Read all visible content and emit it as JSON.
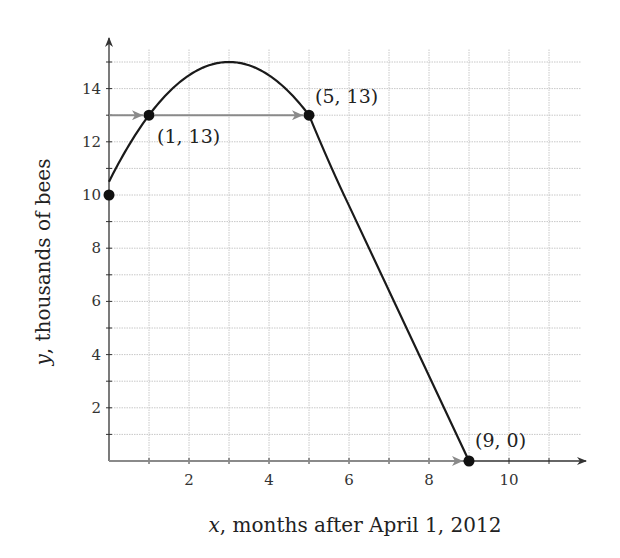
{
  "chart_data": {
    "type": "line",
    "title": "",
    "xlabel": "x, months after April 1, 2012",
    "xlabel_var": "x",
    "xlabel_rest": ", months after April 1, 2012",
    "ylabel": "y, thousands of bees",
    "ylabel_var": "y",
    "ylabel_rest": ", thousands of bees",
    "xlim": [
      0,
      12
    ],
    "ylim": [
      0,
      16
    ],
    "x_ticks": [
      2,
      4,
      6,
      8,
      10
    ],
    "y_ticks": [
      2,
      4,
      6,
      8,
      10,
      12,
      14
    ],
    "grid": true,
    "grid_x_step": 1,
    "grid_y_step": 1,
    "series": [
      {
        "name": "bee population",
        "piecewise": [
          {
            "form": "quadratic",
            "equation": "y = -1/2 (x-3)^2 + 15",
            "domain": [
              0,
              5
            ]
          },
          {
            "form": "linear",
            "from": [
              5,
              13
            ],
            "to": [
              9,
              0
            ]
          }
        ],
        "x": [
          0,
          0.5,
          1,
          1.5,
          2,
          2.5,
          3,
          3.5,
          4,
          4.5,
          5,
          6,
          7,
          8,
          9
        ],
        "values": [
          10.5,
          11.875,
          13,
          13.875,
          14.5,
          14.875,
          15,
          14.875,
          14.5,
          13.875,
          13,
          9.75,
          6.5,
          3.25,
          0
        ]
      }
    ],
    "marked_points": [
      {
        "x": 0,
        "y": 10,
        "label": ""
      },
      {
        "x": 1,
        "y": 13,
        "label": "(1, 13)"
      },
      {
        "x": 5,
        "y": 13,
        "label": "(5, 13)"
      },
      {
        "x": 9,
        "y": 0,
        "label": "(9, 0)"
      }
    ],
    "annotations": [
      {
        "type": "arrow",
        "from": [
          0,
          13
        ],
        "to": [
          1,
          13
        ]
      },
      {
        "type": "arrow",
        "from": [
          1,
          13
        ],
        "to": [
          5,
          13
        ]
      },
      {
        "type": "arrow",
        "from": [
          0,
          0
        ],
        "to": [
          9,
          0
        ]
      }
    ]
  },
  "colors": {
    "curve": "#1a1a1a",
    "axis": "#333333",
    "grid": "#c8c8c8",
    "arrow": "#8a8a8a",
    "point": "#111111"
  }
}
